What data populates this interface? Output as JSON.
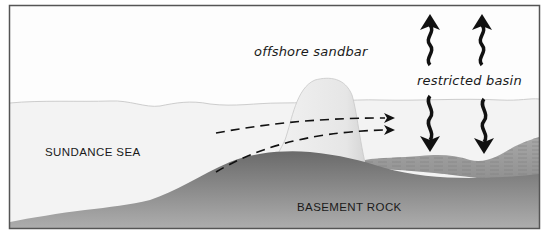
{
  "diagram": {
    "labels": {
      "sandbar": "offshore sandbar",
      "basin": "restricted basin",
      "sea": "SUNDANCE SEA",
      "rock": "BASEMENT ROCK"
    },
    "colors": {
      "frame": "#555555",
      "sky": "#fdfdfd",
      "water": "#f3f3f3",
      "water_surface": "#cfcfcf",
      "sandbar_light": "#f2f2f2",
      "sandbar_dark": "#cfcfcf",
      "rock_top": "#6e6e6e",
      "rock_bottom": "#a9a9a9",
      "basin_sediment": "#9a9a9a",
      "arrow": "#111111"
    },
    "arrows": {
      "evaporation_up": 2,
      "inflow_down": 2,
      "dashed_flow": 2
    }
  }
}
